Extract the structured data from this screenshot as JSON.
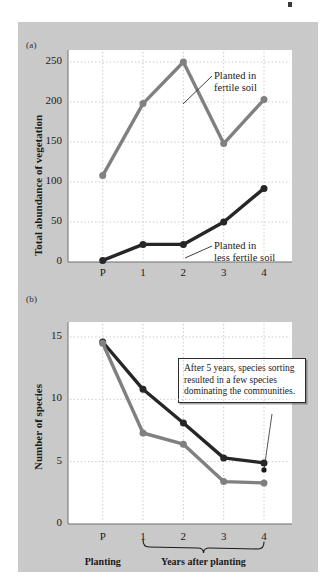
{
  "figure": {
    "panel_a_letter": "(a)",
    "panel_b_letter": "(b)",
    "background_color": "#c9c9c9",
    "plot_color": "#ffffff",
    "series_colors": {
      "fertile": "#808080",
      "less_fertile": "#262626"
    }
  },
  "axis_labels": {
    "planting": "Planting",
    "years_after_planting": "Years after planting"
  },
  "callouts": {
    "fertile_line1": "Planted in",
    "fertile_line2": "fertile soil",
    "less_fertile_line1": "Planted in",
    "less_fertile_line2": "less fertile soil"
  },
  "annotation": {
    "line1": "After 5 years, species",
    "line2": "sorting resulted in a",
    "line3": "few species dominating",
    "line4": "the communities."
  },
  "ticks": {
    "panel_a_y": [
      "250",
      "200",
      "150",
      "100",
      "50",
      "0"
    ],
    "panel_b_y": [
      "15",
      "10",
      "5",
      "0"
    ],
    "x": [
      "P",
      "1",
      "2",
      "3",
      "4"
    ]
  },
  "chart_data": [
    {
      "type": "line",
      "panel": "(a)",
      "title": "",
      "xlabel": "",
      "ylabel": "Total abundance of vegetation",
      "categories": [
        "P",
        "1",
        "2",
        "3",
        "4"
      ],
      "xtick_labels": [
        "P",
        "1",
        "2",
        "3",
        "4"
      ],
      "ytick_labels": [
        "0",
        "50",
        "100",
        "150",
        "200",
        "250"
      ],
      "ylim": [
        0,
        265
      ],
      "grid": true,
      "legend": "annotated labels",
      "series": [
        {
          "name": "Planted in fertile soil",
          "color": "#808080",
          "values": [
            108,
            198,
            250,
            148,
            203
          ]
        },
        {
          "name": "Planted in less fertile soil",
          "color": "#262626",
          "values": [
            2,
            22,
            22,
            50,
            92
          ]
        }
      ]
    },
    {
      "type": "line",
      "panel": "(b)",
      "title": "",
      "xlabel": "Years after planting",
      "ylabel": "Number of species",
      "categories": [
        "P",
        "1",
        "2",
        "3",
        "4"
      ],
      "xtick_labels": [
        "P",
        "1",
        "2",
        "3",
        "4"
      ],
      "ytick_labels": [
        "0",
        "5",
        "10",
        "15"
      ],
      "ylim": [
        0,
        16.2
      ],
      "grid": true,
      "annotations": [
        "After 5 years, species sorting resulted in a few species dominating the communities."
      ],
      "series": [
        {
          "name": "Planted in less fertile soil",
          "color": "#262626",
          "values": [
            14.6,
            10.8,
            8.1,
            5.3,
            4.9
          ]
        },
        {
          "name": "Planted in fertile soil",
          "color": "#808080",
          "values": [
            14.5,
            7.3,
            6.4,
            3.4,
            3.3
          ]
        }
      ]
    }
  ]
}
